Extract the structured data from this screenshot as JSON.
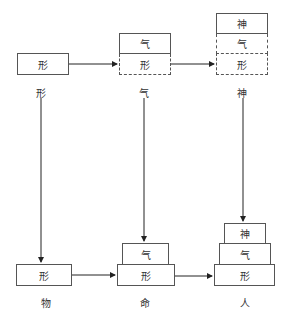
{
  "diagram": {
    "top_row": {
      "col1": {
        "boxes": [
          "形"
        ],
        "label": "形"
      },
      "col2": {
        "boxes": [
          "气",
          "形"
        ],
        "label": "气"
      },
      "col3": {
        "boxes": [
          "神",
          "气",
          "形"
        ],
        "label": "神"
      }
    },
    "bottom_row": {
      "col1": {
        "boxes": [
          "形"
        ],
        "label": "物"
      },
      "col2": {
        "boxes": [
          "气",
          "形"
        ],
        "label": "命"
      },
      "col3": {
        "boxes": [
          "神",
          "气",
          "形"
        ],
        "label": "人"
      }
    },
    "colors": {
      "line": "#222222",
      "border": "#555555",
      "text": "#333333"
    }
  }
}
